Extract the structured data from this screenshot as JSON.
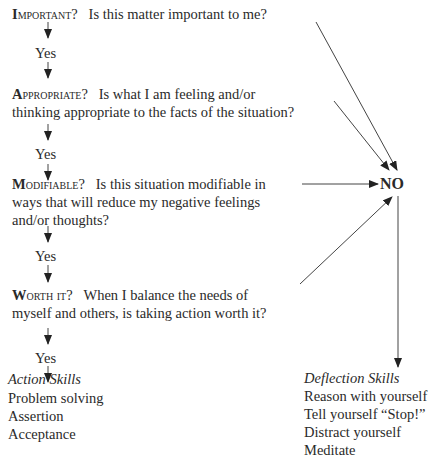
{
  "questions": [
    {
      "key_initial": "I",
      "key_rest": "mportant?",
      "line1": "Is this matter important to me?",
      "line2": "",
      "line3": ""
    },
    {
      "key_initial": "A",
      "key_rest": "ppropriate?",
      "line1": "Is what I am feeling and/or",
      "line2": "thinking appropriate to the facts of the situation?",
      "line3": ""
    },
    {
      "key_initial": "M",
      "key_rest": "odifiable?",
      "line1": "Is this situation modifiable in",
      "line2": "ways that will reduce my negative feelings",
      "line3": "and/or thoughts?"
    },
    {
      "key_initial": "W",
      "key_rest": "orth it?",
      "line1": "When I balance the needs of",
      "line2": "myself and others, is taking action worth it?",
      "line3": ""
    }
  ],
  "yes_label": "Yes",
  "no_label": "NO",
  "action": {
    "title": "Action Skills",
    "items": [
      "Problem solving",
      "Assertion",
      "Acceptance"
    ]
  },
  "deflection": {
    "title": "Deflection Skills",
    "items": [
      "Reason with yourself",
      "Tell yourself “Stop!”",
      "Distract yourself",
      "Meditate"
    ]
  },
  "colors": {
    "text": "#2a2a2a",
    "lines": "#444444"
  }
}
